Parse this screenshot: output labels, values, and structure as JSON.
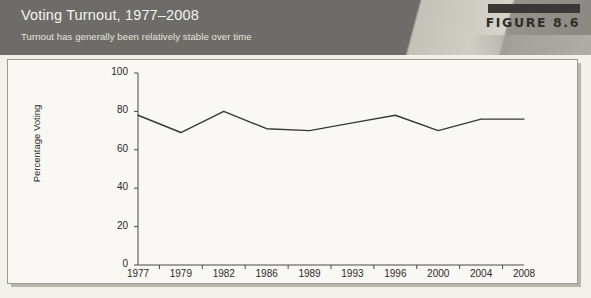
{
  "header": {
    "title": "Voting Turnout, 1977–2008",
    "subtitle": "Turnout has generally been relatively stable over time",
    "figure_label": "FIGURE 8.6",
    "band_color": "#6e6c68",
    "badge_color": "#3a3834",
    "title_color": "#f4f3f0"
  },
  "panel": {
    "background": "#faf8f4",
    "border_color": "#9d9a94"
  },
  "chart_data": {
    "type": "line",
    "title": "Voting Turnout, 1977–2008",
    "subtitle": "Turnout has generally been relatively stable over time",
    "xlabel": "",
    "ylabel": "Percentage Voting",
    "categories": [
      "1977",
      "1979",
      "1982",
      "1986",
      "1989",
      "1993",
      "1996",
      "2000",
      "2004",
      "2008"
    ],
    "values": [
      78,
      69,
      80,
      71,
      70,
      74,
      78,
      70,
      76,
      76
    ],
    "ylim": [
      0,
      100
    ],
    "yticks": [
      0,
      20,
      40,
      60,
      80,
      100
    ],
    "ytick_labels": [
      "0",
      "20",
      "40",
      "60",
      "80",
      "100"
    ],
    "grid": false,
    "legend": null,
    "line_color": "#3a3834",
    "series": [
      {
        "name": "Percentage Voting",
        "values": [
          78,
          69,
          80,
          71,
          70,
          74,
          78,
          70,
          76,
          76
        ]
      }
    ]
  }
}
